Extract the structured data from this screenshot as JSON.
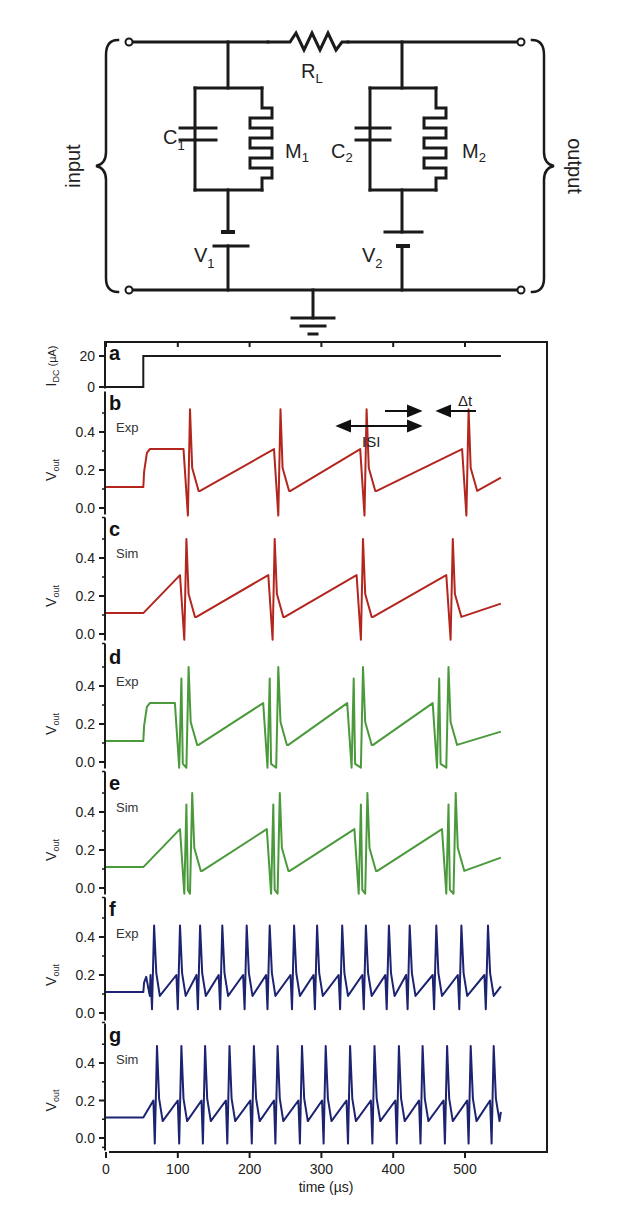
{
  "circuit": {
    "input_label": "input",
    "output_label": "output",
    "load_resistor": {
      "symbol": "R",
      "subscript": "L"
    },
    "capacitors": [
      {
        "symbol": "C",
        "subscript": "1"
      },
      {
        "symbol": "C",
        "subscript": "2"
      }
    ],
    "memristors": [
      {
        "symbol": "M",
        "subscript": "1"
      },
      {
        "symbol": "M",
        "subscript": "2"
      }
    ],
    "sources": [
      {
        "symbol": "V",
        "subscript": "1"
      },
      {
        "symbol": "V",
        "subscript": "2"
      }
    ],
    "icons": [
      "resistor-icon",
      "capacitor-icon",
      "memristor-icon",
      "battery-icon",
      "ground-icon",
      "terminal-icon",
      "brace-icon"
    ]
  },
  "axes": {
    "xlabel": "time (µs)",
    "xticks": [
      "0",
      "100",
      "200",
      "300",
      "400",
      "500"
    ],
    "xlim": [
      0,
      550
    ],
    "panel_a_ylabel": {
      "main": "I",
      "sub": "DC",
      "unit": " (µA)"
    },
    "panel_a_yticks": [
      "20",
      "0"
    ],
    "vout_ylabel": {
      "main": "V",
      "sub": "out"
    },
    "vout_yticks": [
      "0.4",
      "0.2",
      "0.0"
    ],
    "annotations": {
      "isi": "ISI",
      "dt": "Δt"
    }
  },
  "colors": {
    "black": "#1a1a1a",
    "red": "#b3261e",
    "green": "#4a9a3c",
    "blue": "#1c2370"
  },
  "chart_data": [
    {
      "panel": "a",
      "type": "line",
      "label": "a",
      "condition": "",
      "ylabel": "I_DC (µA)",
      "ylim": [
        0,
        20
      ],
      "series": [
        {
          "name": "I_DC",
          "color": "#1a1a1a",
          "x": [
            0,
            52,
            52,
            550
          ],
          "values": [
            0,
            0,
            20,
            20
          ]
        }
      ]
    },
    {
      "panel": "b",
      "type": "line",
      "label": "b",
      "condition": "Exp",
      "ylabel": "V_out",
      "ylim": [
        -0.05,
        0.55
      ],
      "spike_pattern": "single",
      "spike_times_us": [
        117,
        243,
        363,
        505
      ],
      "peak": 0.52,
      "trough": -0.04,
      "baseline": 0.11,
      "annotations": [
        "ISI",
        "Δt"
      ]
    },
    {
      "panel": "c",
      "type": "line",
      "label": "c",
      "condition": "Sim",
      "ylabel": "V_out",
      "ylim": [
        -0.05,
        0.55
      ],
      "spike_pattern": "single",
      "spike_times_us": [
        112,
        235,
        358,
        483
      ],
      "peak": 0.5,
      "trough": -0.03,
      "baseline": 0.11
    },
    {
      "panel": "d",
      "type": "line",
      "label": "d",
      "condition": "Exp",
      "ylabel": "V_out",
      "ylim": [
        -0.05,
        0.55
      ],
      "spike_pattern": "doublet",
      "spike_times_us": [
        105,
        115,
        228,
        240,
        345,
        358,
        464,
        477
      ],
      "peak": 0.5,
      "trough": -0.03,
      "baseline": 0.11
    },
    {
      "panel": "e",
      "type": "line",
      "label": "e",
      "condition": "Sim",
      "ylabel": "V_out",
      "ylim": [
        -0.05,
        0.55
      ],
      "spike_pattern": "doublet",
      "spike_times_us": [
        112,
        120,
        233,
        242,
        355,
        364,
        477,
        487
      ],
      "peak": 0.5,
      "trough": -0.03,
      "baseline": 0.11
    },
    {
      "panel": "f",
      "type": "line",
      "label": "f",
      "condition": "Exp",
      "ylabel": "V_out",
      "ylim": [
        -0.05,
        0.55
      ],
      "spike_pattern": "tonic",
      "spike_times_us": [
        67,
        103,
        131,
        162,
        196,
        228,
        262,
        294,
        329,
        362,
        394,
        423,
        460,
        495,
        532
      ],
      "peak": 0.46,
      "trough": 0.02,
      "baseline": 0.11
    },
    {
      "panel": "g",
      "type": "line",
      "label": "g",
      "condition": "Sim",
      "ylabel": "V_out",
      "ylim": [
        -0.05,
        0.55
      ],
      "spike_pattern": "tonic",
      "spike_times_us": [
        71,
        105,
        138,
        172,
        206,
        239,
        273,
        306,
        340,
        374,
        408,
        441,
        475,
        508,
        540
      ],
      "peak": 0.49,
      "trough": -0.03,
      "baseline": 0.11
    }
  ]
}
